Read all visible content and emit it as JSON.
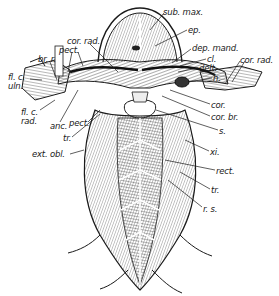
{
  "figure": {
    "colors": {
      "ink": "#1a1a1a",
      "background": "#ffffff",
      "shade": "#8a8a8a"
    },
    "labels": [
      {
        "id": "sub_max",
        "text": "sub. max.",
        "x": 163,
        "y": 8
      },
      {
        "id": "ep",
        "text": "ep.",
        "x": 188,
        "y": 26
      },
      {
        "id": "cor_rad_left",
        "text": "cor. rad.",
        "x": 67,
        "y": 37
      },
      {
        "id": "pect_top",
        "text": "pect.",
        "x": 59,
        "y": 46
      },
      {
        "id": "br_r",
        "text": "br. r.",
        "x": 38,
        "y": 55
      },
      {
        "id": "dep_mand",
        "text": "dep. mand.",
        "x": 192,
        "y": 44
      },
      {
        "id": "cl",
        "text": "cl.",
        "x": 207,
        "y": 55
      },
      {
        "id": "delt",
        "text": "delt.",
        "x": 199,
        "y": 64
      },
      {
        "id": "cor_rad_right",
        "text": "cor. rad.",
        "x": 240,
        "y": 56
      },
      {
        "id": "h",
        "text": "h.",
        "x": 213,
        "y": 74
      },
      {
        "id": "fl_c_uln_1",
        "text": "fl. c.",
        "x": 8,
        "y": 73
      },
      {
        "id": "fl_c_uln_2",
        "text": "uln.",
        "x": 8,
        "y": 82
      },
      {
        "id": "fl_c_rad_1",
        "text": "fl. c.",
        "x": 21,
        "y": 108
      },
      {
        "id": "fl_c_rad_2",
        "text": "rad.",
        "x": 21,
        "y": 117
      },
      {
        "id": "anc",
        "text": "anc.",
        "x": 50,
        "y": 122
      },
      {
        "id": "pect_bottom",
        "text": "pect.",
        "x": 69,
        "y": 119
      },
      {
        "id": "tr_left",
        "text": "tr.",
        "x": 63,
        "y": 134
      },
      {
        "id": "cor",
        "text": "cor.",
        "x": 211,
        "y": 101
      },
      {
        "id": "cor_br",
        "text": "cor. br.",
        "x": 211,
        "y": 113
      },
      {
        "id": "s",
        "text": "s.",
        "x": 219,
        "y": 127
      },
      {
        "id": "ext_obl",
        "text": "ext. obl.",
        "x": 32,
        "y": 150
      },
      {
        "id": "xi",
        "text": "xi.",
        "x": 210,
        "y": 148
      },
      {
        "id": "rect",
        "text": "rect.",
        "x": 216,
        "y": 167
      },
      {
        "id": "tr_right",
        "text": "tr.",
        "x": 211,
        "y": 186
      },
      {
        "id": "r_s",
        "text": "r. s.",
        "x": 203,
        "y": 205
      }
    ]
  }
}
